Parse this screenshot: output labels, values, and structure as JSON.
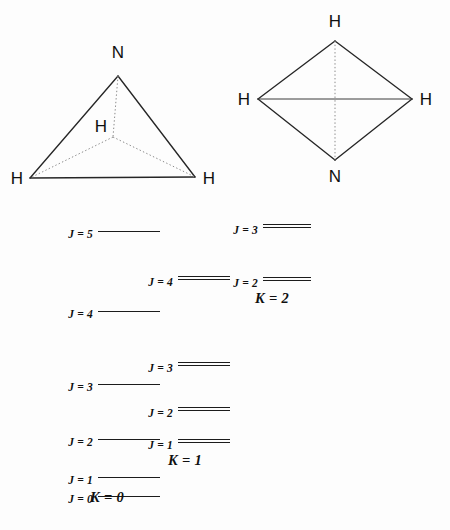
{
  "figure": {
    "background_color": "#fdfdfd",
    "line_color": "#1c1c1c",
    "dotted_line_color": "#8a8a8a"
  },
  "molecules": [
    {
      "name": "pyramidal-ammonia",
      "atoms": [
        {
          "label": "N",
          "position": "apex-top"
        },
        {
          "label": "H",
          "position": "back-center"
        },
        {
          "label": "H",
          "position": "front-left"
        },
        {
          "label": "H",
          "position": "front-right"
        }
      ]
    },
    {
      "name": "planar-ammonia",
      "atoms": [
        {
          "label": "H",
          "position": "top"
        },
        {
          "label": "H",
          "position": "left"
        },
        {
          "label": "H",
          "position": "right"
        },
        {
          "label": "N",
          "position": "bottom"
        }
      ]
    }
  ],
  "chart_data": {
    "type": "table",
    "xlabel": "K",
    "ylabel": "Energy",
    "stacks": [
      {
        "k_label": "K = 0",
        "k_value": 0,
        "multiplicity": 1,
        "levels": [
          {
            "label": "J = 5",
            "j": 5,
            "energy": 232
          },
          {
            "label": "J = 4",
            "j": 4,
            "energy": 312
          },
          {
            "label": "J = 3",
            "j": 3,
            "energy": 385
          },
          {
            "label": "J = 2",
            "j": 2,
            "energy": 440
          },
          {
            "label": "J = 1",
            "j": 1,
            "energy": 478
          },
          {
            "label": "J = 0",
            "j": 0,
            "energy": 497
          }
        ]
      },
      {
        "k_label": "K = 1",
        "k_value": 1,
        "multiplicity": 2,
        "levels": [
          {
            "label": "J = 4",
            "j": 4,
            "energy": 280
          },
          {
            "label": "J = 3",
            "j": 3,
            "energy": 366
          },
          {
            "label": "J = 2",
            "j": 2,
            "energy": 411
          },
          {
            "label": "J = 1",
            "j": 1,
            "energy": 443
          }
        ]
      },
      {
        "k_label": "K = 2",
        "k_value": 2,
        "multiplicity": 2,
        "levels": [
          {
            "label": "J = 3",
            "j": 3,
            "energy": 228
          },
          {
            "label": "J = 2",
            "j": 2,
            "energy": 281
          }
        ]
      }
    ]
  }
}
